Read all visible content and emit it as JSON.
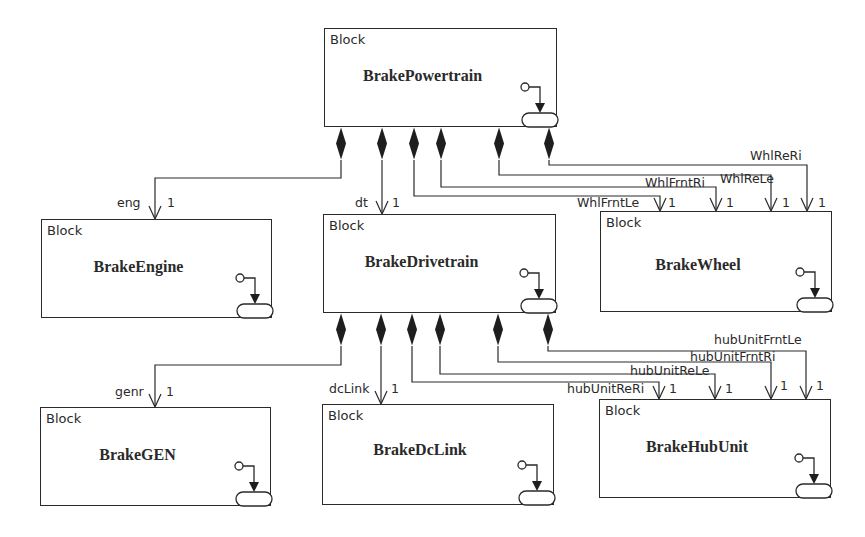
{
  "diagram": {
    "type": "SysML Block Definition Diagram",
    "stereotype": "Block",
    "blocks": [
      {
        "id": "powertrain",
        "name": "BrakePowertrain",
        "stereotype": "Block"
      },
      {
        "id": "engine",
        "name": "BrakeEngine",
        "stereotype": "Block"
      },
      {
        "id": "drivetrain",
        "name": "BrakeDrivetrain",
        "stereotype": "Block"
      },
      {
        "id": "wheel",
        "name": "BrakeWheel",
        "stereotype": "Block"
      },
      {
        "id": "gen",
        "name": "BrakeGEN",
        "stereotype": "Block"
      },
      {
        "id": "dclink",
        "name": "BrakeDcLink",
        "stereotype": "Block"
      },
      {
        "id": "hubunit",
        "name": "BrakeHubUnit",
        "stereotype": "Block"
      }
    ],
    "compositions": [
      {
        "from": "BrakePowertrain",
        "to": "BrakeEngine",
        "role": "eng",
        "multiplicity": "1"
      },
      {
        "from": "BrakePowertrain",
        "to": "BrakeDrivetrain",
        "role": "dt",
        "multiplicity": "1"
      },
      {
        "from": "BrakePowertrain",
        "to": "BrakeWheel",
        "role": "WhlFrntLe",
        "multiplicity": "1"
      },
      {
        "from": "BrakePowertrain",
        "to": "BrakeWheel",
        "role": "WhlFrntRi",
        "multiplicity": "1"
      },
      {
        "from": "BrakePowertrain",
        "to": "BrakeWheel",
        "role": "WhlReLe",
        "multiplicity": "1"
      },
      {
        "from": "BrakePowertrain",
        "to": "BrakeWheel",
        "role": "WhlReRi",
        "multiplicity": "1"
      },
      {
        "from": "BrakeDrivetrain",
        "to": "BrakeGEN",
        "role": "genr",
        "multiplicity": "1"
      },
      {
        "from": "BrakeDrivetrain",
        "to": "BrakeDcLink",
        "role": "dcLink",
        "multiplicity": "1"
      },
      {
        "from": "BrakeDrivetrain",
        "to": "BrakeHubUnit",
        "role": "hubUnitReRi",
        "multiplicity": "1"
      },
      {
        "from": "BrakeDrivetrain",
        "to": "BrakeHubUnit",
        "role": "hubUnitReLe",
        "multiplicity": "1"
      },
      {
        "from": "BrakeDrivetrain",
        "to": "BrakeHubUnit",
        "role": "hubUnitFrntRi",
        "multiplicity": "1"
      },
      {
        "from": "BrakeDrivetrain",
        "to": "BrakeHubUnit",
        "role": "hubUnitFrntLe",
        "multiplicity": "1"
      }
    ],
    "colors": {
      "line": "#2a2a2a",
      "background": "#ffffff"
    }
  }
}
